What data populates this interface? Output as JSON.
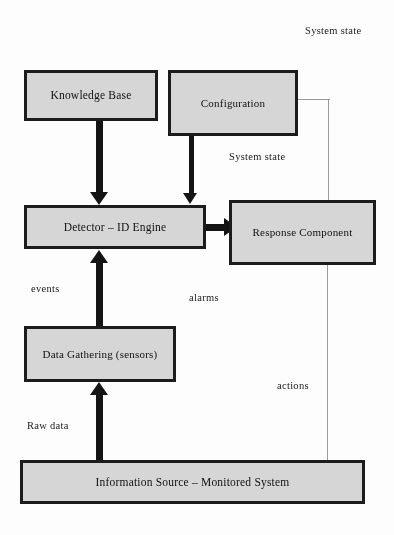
{
  "diagram": {
    "type": "block-diagram",
    "background_color": "#fdfdfd",
    "box_fill_color": "#d6d6d6",
    "box_border_color": "#1c1c1c",
    "thin_line_color": "#9a9a9a",
    "nodes": [
      {
        "id": "knowledge-base",
        "label": "Knowledge Base"
      },
      {
        "id": "configuration",
        "label": "Configuration"
      },
      {
        "id": "detector",
        "label": "Detector – ID Engine"
      },
      {
        "id": "response",
        "label": "Response Component"
      },
      {
        "id": "data-gathering",
        "label": "Data Gathering (sensors)"
      },
      {
        "id": "info-source",
        "label": "Information Source – Monitored System"
      }
    ],
    "edge_labels": {
      "system_state_top": "System state",
      "system_state_mid": "System state",
      "events": "events",
      "alarms": "alarms",
      "actions": "actions",
      "raw_data": "Raw data"
    },
    "edges": [
      {
        "from": "knowledge-base",
        "to": "detector",
        "style": "thick-arrow",
        "label": ""
      },
      {
        "from": "configuration",
        "to": "detector",
        "style": "thick-arrow",
        "label": ""
      },
      {
        "from": "detector",
        "to": "response",
        "style": "thick-arrow",
        "label": "alarms"
      },
      {
        "from": "data-gathering",
        "to": "detector",
        "style": "thick-arrow",
        "label": "events"
      },
      {
        "from": "info-source",
        "to": "data-gathering",
        "style": "thick-arrow",
        "label": "Raw data"
      },
      {
        "from": "configuration",
        "to": "response",
        "style": "thin-line",
        "label": "System state"
      },
      {
        "from": "response",
        "to": "info-source",
        "style": "thin-line",
        "label": "actions"
      }
    ]
  }
}
